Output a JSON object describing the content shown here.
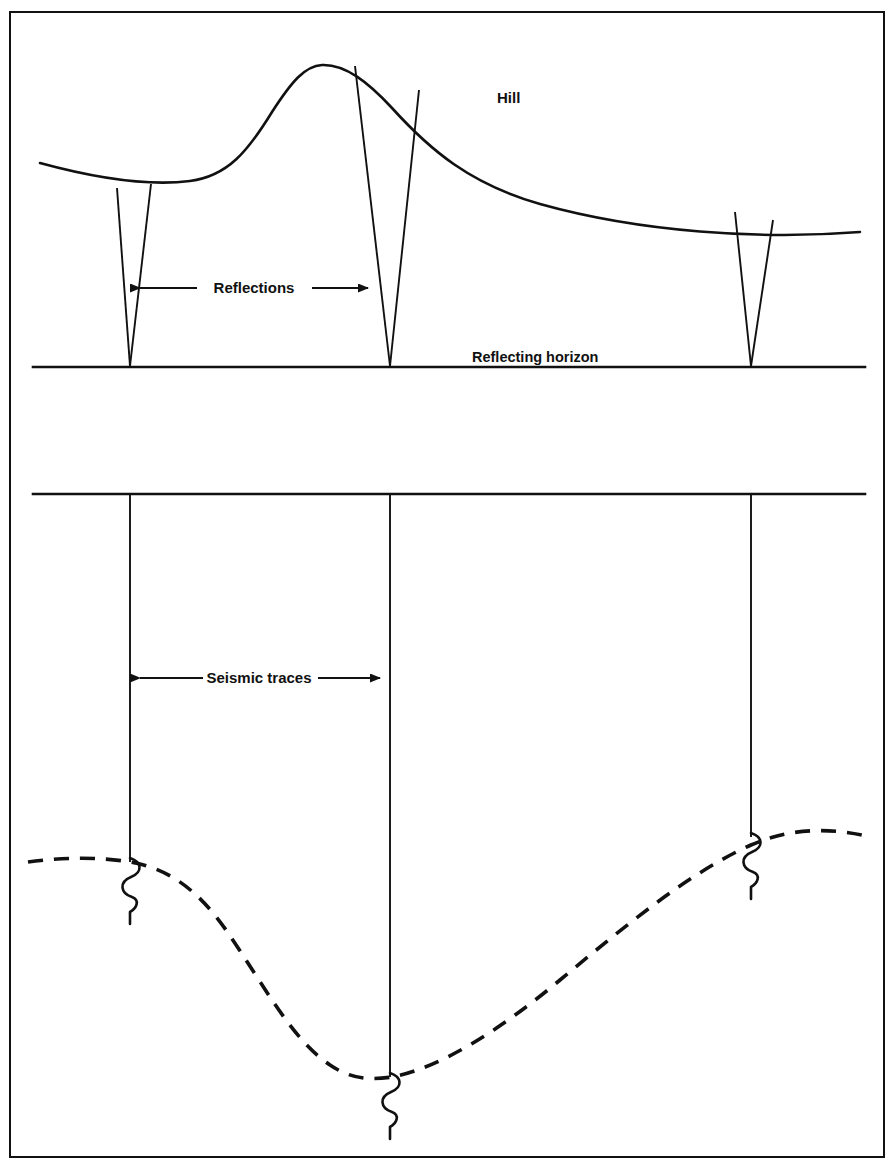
{
  "figure": {
    "kind": "seismic-reflection-diagram",
    "width": 892,
    "height": 1166,
    "background_color": "#ffffff",
    "line_color": "#111111",
    "frame": {
      "x": 10,
      "y": 12,
      "width": 874,
      "height": 1145,
      "stroke_width": 2
    }
  },
  "labels": {
    "hill": "Hill",
    "reflections": "Reflections",
    "reflecting_horizon": "Reflecting horizon",
    "seismic_traces": "Seismic traces"
  },
  "upper_panel": {
    "name": "ray-path-cross-section",
    "hill_surface": {
      "description": "topographic hill profile",
      "path": "M 40 163 C 95 178, 150 186, 190 181 C 228 176, 248 151, 272 112 C 292 81, 305 66, 322 65 C 345 64, 368 82, 392 108 C 430 150, 470 184, 540 204 C 640 232, 760 240, 860 232"
    },
    "reflecting_horizon_line": {
      "x1": 33,
      "y1": 367,
      "x2": 865,
      "y2": 367,
      "stroke_width": 2.5
    },
    "reflection_pairs": [
      {
        "name": "reflection-ray-pair-left",
        "apex_x": 130,
        "apex_y": 366,
        "left_top_x": 117,
        "left_top_y": 188,
        "right_top_x": 151,
        "right_top_y": 184
      },
      {
        "name": "reflection-ray-pair-center",
        "apex_x": 390,
        "apex_y": 366,
        "left_top_x": 355,
        "left_top_y": 66,
        "right_top_x": 419,
        "right_top_y": 90
      },
      {
        "name": "reflection-ray-pair-right",
        "apex_x": 751,
        "apex_y": 366,
        "left_top_x": 735,
        "left_top_y": 212,
        "right_top_x": 773,
        "right_top_y": 220
      }
    ],
    "reflections_arrow": {
      "y": 288,
      "x_left": 140,
      "x_right": 368,
      "text_x": 254,
      "text_y": 293,
      "double_headed": true
    },
    "hill_label_pos": {
      "x": 497,
      "y": 103
    },
    "horizon_label_pos": {
      "x": 472,
      "y": 362
    }
  },
  "lower_panel": {
    "name": "seismic-section",
    "datum_line": {
      "x1": 33,
      "y1": 494,
      "x2": 865,
      "y2": 494,
      "stroke_width": 2.5
    },
    "traces": [
      {
        "name": "seismic-trace-left",
        "x": 130,
        "y_top": 494,
        "y_bottom": 862
      },
      {
        "name": "seismic-trace-center",
        "x": 390,
        "y_top": 494,
        "y_bottom": 1077
      },
      {
        "name": "seismic-trace-right",
        "x": 751,
        "y_top": 494,
        "y_bottom": 837
      }
    ],
    "seismic_traces_arrow": {
      "y": 678,
      "x_left": 140,
      "x_right": 380,
      "text_x": 259,
      "text_y": 683,
      "double_headed": true
    },
    "dashed_reflector": {
      "description": "migrated/unmigrated syncline reflection event, dashed",
      "dash_pattern": "15 11",
      "stroke_width": 3.5,
      "path": "M 28 862 C 65 857, 100 857, 130 862 C 168 868, 198 890, 226 930 C 262 982, 292 1040, 330 1065 C 352 1080, 372 1080, 392 1077 C 440 1068, 500 1030, 560 980 C 625 926, 690 872, 751 845 C 790 828, 828 828, 862 835"
    },
    "wiggles": [
      {
        "name": "wavelet-left",
        "x": 130,
        "y": 862,
        "amplitude": 13,
        "length": 68
      },
      {
        "name": "wavelet-center",
        "x": 390,
        "y": 1077,
        "amplitude": 13,
        "length": 68
      },
      {
        "name": "wavelet-right",
        "x": 751,
        "y": 837,
        "amplitude": 13,
        "length": 68
      }
    ]
  }
}
